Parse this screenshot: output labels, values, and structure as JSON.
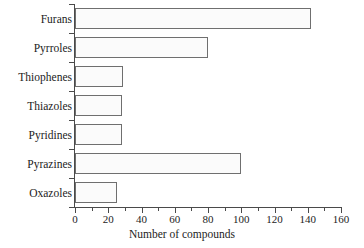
{
  "chart_data": {
    "type": "bar",
    "orientation": "horizontal",
    "title": "",
    "xlabel": "Number of compounds",
    "ylabel": "",
    "categories": [
      "Furans",
      "Pyrroles",
      "Thiophenes",
      "Thiazoles",
      "Pyridines",
      "Pyrazines",
      "Oxazoles"
    ],
    "values": [
      142,
      80,
      29,
      28,
      28,
      100,
      25
    ],
    "xlim": [
      0,
      160
    ],
    "xticks": [
      0,
      20,
      40,
      60,
      80,
      100,
      120,
      140,
      160
    ],
    "xtick_labels": [
      "0",
      "20",
      "40",
      "60",
      "80",
      "100",
      "120",
      "140",
      "160"
    ],
    "minor_tick_step": 10,
    "grid": false,
    "legend": null,
    "series": [
      {
        "name": "Number of compounds",
        "values": [
          142,
          80,
          29,
          28,
          28,
          100,
          25
        ]
      }
    ],
    "bar_fill_color": "#fbfbfb",
    "bar_border_color": "#6f6f6f",
    "axis_color": "#4a4a4a",
    "background_color": "#ffffff"
  }
}
